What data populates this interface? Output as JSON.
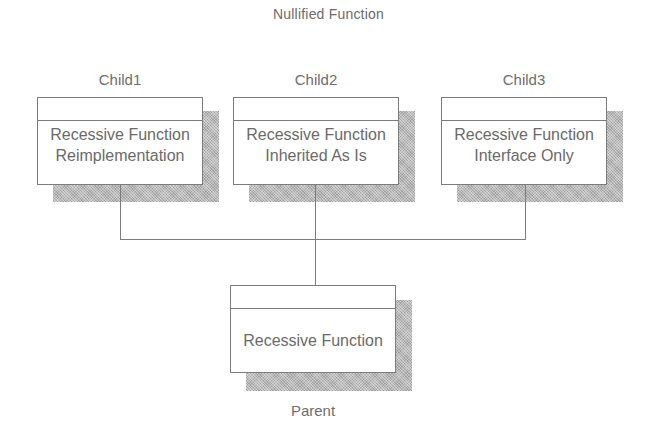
{
  "diagram": {
    "title": "Nullified Function",
    "children": [
      {
        "name": "Child1",
        "lines": [
          "Recessive Function",
          "Reimplementation"
        ]
      },
      {
        "name": "Child2",
        "lines": [
          "Recessive Function",
          "Inherited As Is"
        ]
      },
      {
        "name": "Child3",
        "lines": [
          "Recessive Function",
          "Interface Only"
        ]
      }
    ],
    "parent": {
      "name": "Parent",
      "lines": [
        "Recessive Function"
      ]
    },
    "colors": {
      "line": "#7c7c7c",
      "shadow": "#b8b8b8",
      "text": "#6a6a6a",
      "background": "#ffffff"
    }
  }
}
